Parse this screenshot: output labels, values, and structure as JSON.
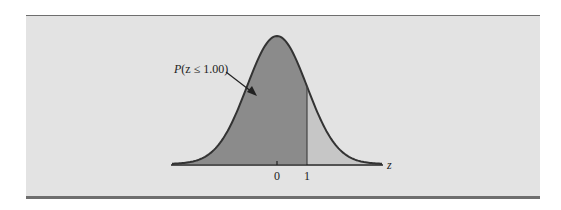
{
  "chart_data": {
    "type": "area",
    "title": "",
    "annotation": "P(z ≤ 1.00)",
    "xlabel": "z",
    "ylabel": "",
    "x_ticks": [
      "0",
      "1"
    ],
    "mean": 0,
    "std": 1,
    "shaded_region": {
      "from": "-inf",
      "to": 1.0,
      "label": "P(z ≤ 1.00)"
    },
    "unshaded_region": {
      "from": 1.0,
      "to": "inf"
    },
    "xlim": [
      -3.5,
      3.5
    ],
    "grid": false,
    "legend": "none"
  },
  "colors": {
    "background": "#e3e3e3",
    "shaded": "#8b8b8b",
    "unshaded": "#c6c6c6",
    "curve": "#333333",
    "rule": "#6e6e6e"
  },
  "labels": {
    "annotation": "P(z ≤ 1.00)",
    "annotation_p": "P",
    "annotation_rest": "(z ≤ 1.00)",
    "axis": "z",
    "tick0": "0",
    "tick1": "1"
  }
}
